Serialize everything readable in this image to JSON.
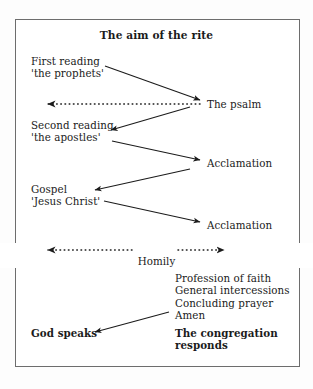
{
  "diagram": {
    "title": "The aim of the rite",
    "border_color": "#6d6d6d",
    "background_color": "#ffffff",
    "ink_color": "#1b1b1b",
    "left_column": [
      {
        "id": "first-reading",
        "text": "First reading\n'the prophets'",
        "x": 31,
        "y": 55,
        "bold": false
      },
      {
        "id": "second-reading",
        "text": "Second reading\n'the apostles'",
        "x": 31,
        "y": 119,
        "bold": false
      },
      {
        "id": "gospel",
        "text": "Gospel\n'Jesus Christ'",
        "x": 31,
        "y": 183,
        "bold": false
      },
      {
        "id": "god-speaks",
        "text": "God speaks",
        "x": 31,
        "y": 327,
        "bold": true
      }
    ],
    "right_column": [
      {
        "id": "the-psalm",
        "text": "The psalm",
        "x": 207,
        "y": 98,
        "bold": false
      },
      {
        "id": "acclamation-1",
        "text": "Acclamation",
        "x": 207,
        "y": 157,
        "bold": false
      },
      {
        "id": "acclamation-2",
        "text": "Acclamation",
        "x": 207,
        "y": 219,
        "bold": false
      },
      {
        "id": "response-list",
        "text": "Profession of faith\nGeneral intercessions\nConcluding prayer\nAmen",
        "x": 175,
        "y": 272,
        "bold": false
      },
      {
        "id": "congregation-responds",
        "text": "The congregation\nresponds",
        "x": 175,
        "y": 327,
        "bold": true
      }
    ],
    "dotted_arrows": [
      {
        "id": "psalm-response-arrow",
        "x1": 200,
        "y1": 104,
        "x2": 44,
        "y2": 104,
        "head": "start",
        "label": ""
      },
      {
        "id": "homily-arrow",
        "x1": 44,
        "y1": 250,
        "x2": 228,
        "y2": 250,
        "head": "both",
        "label": "Homily",
        "label_x": 136,
        "label_y": 250
      }
    ],
    "solid_arrows": [
      {
        "id": "first-reading-to-psalm",
        "x1": 105,
        "y1": 66,
        "x2": 200,
        "y2": 100
      },
      {
        "id": "psalm-to-second-reading",
        "x1": 190,
        "y1": 107,
        "x2": 111,
        "y2": 130
      },
      {
        "id": "second-reading-to-acclamation-1",
        "x1": 112,
        "y1": 141,
        "x2": 200,
        "y2": 160
      },
      {
        "id": "acclamation-1-to-gospel",
        "x1": 190,
        "y1": 169,
        "x2": 95,
        "y2": 190
      },
      {
        "id": "gospel-to-acclamation-2",
        "x1": 104,
        "y1": 201,
        "x2": 200,
        "y2": 222
      },
      {
        "id": "responses-to-god-speaks",
        "x1": 169,
        "y1": 312,
        "x2": 95,
        "y2": 332
      }
    ],
    "homily_label": "Homily"
  }
}
